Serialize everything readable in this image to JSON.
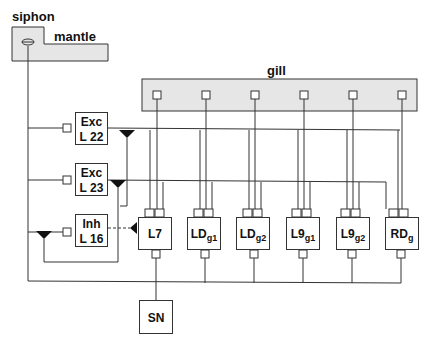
{
  "title_labels": {
    "siphon": "siphon",
    "mantle": "mantle",
    "gill": "gill"
  },
  "interneurons": [
    {
      "type": "Exc",
      "name": "L 22"
    },
    {
      "type": "Exc",
      "name": "L 23"
    },
    {
      "type": "Inh",
      "name": "L 16"
    }
  ],
  "motor_neurons": [
    {
      "main": "L7",
      "sub": ""
    },
    {
      "main": "LD",
      "sub": "g1"
    },
    {
      "main": "LD",
      "sub": "g2"
    },
    {
      "main": "L9",
      "sub": "g1"
    },
    {
      "main": "L9",
      "sub": "g2"
    },
    {
      "main": "RD",
      "sub": "g"
    }
  ],
  "sensory": {
    "label": "SN"
  },
  "colors": {
    "line": "#333333",
    "fill_tissue": "#e6e6e6",
    "text": "#111111"
  }
}
